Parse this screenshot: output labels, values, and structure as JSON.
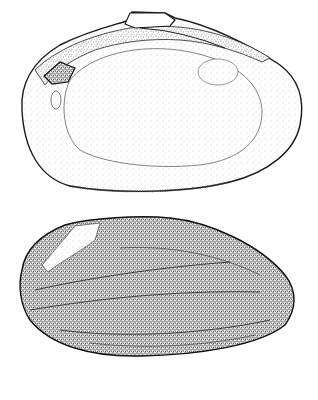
{
  "figure": {
    "views": [
      {
        "name": "interior-valve",
        "description": "interior view of left valve showing hinge teeth and muscle scars"
      },
      {
        "name": "exterior-valve",
        "description": "exterior view of valve with concentric growth lines"
      }
    ],
    "colors": {
      "ink": "#1a1a1a",
      "background": "#ffffff",
      "stipple_light": "#bdbdbd",
      "stipple_dark": "#555555"
    }
  }
}
